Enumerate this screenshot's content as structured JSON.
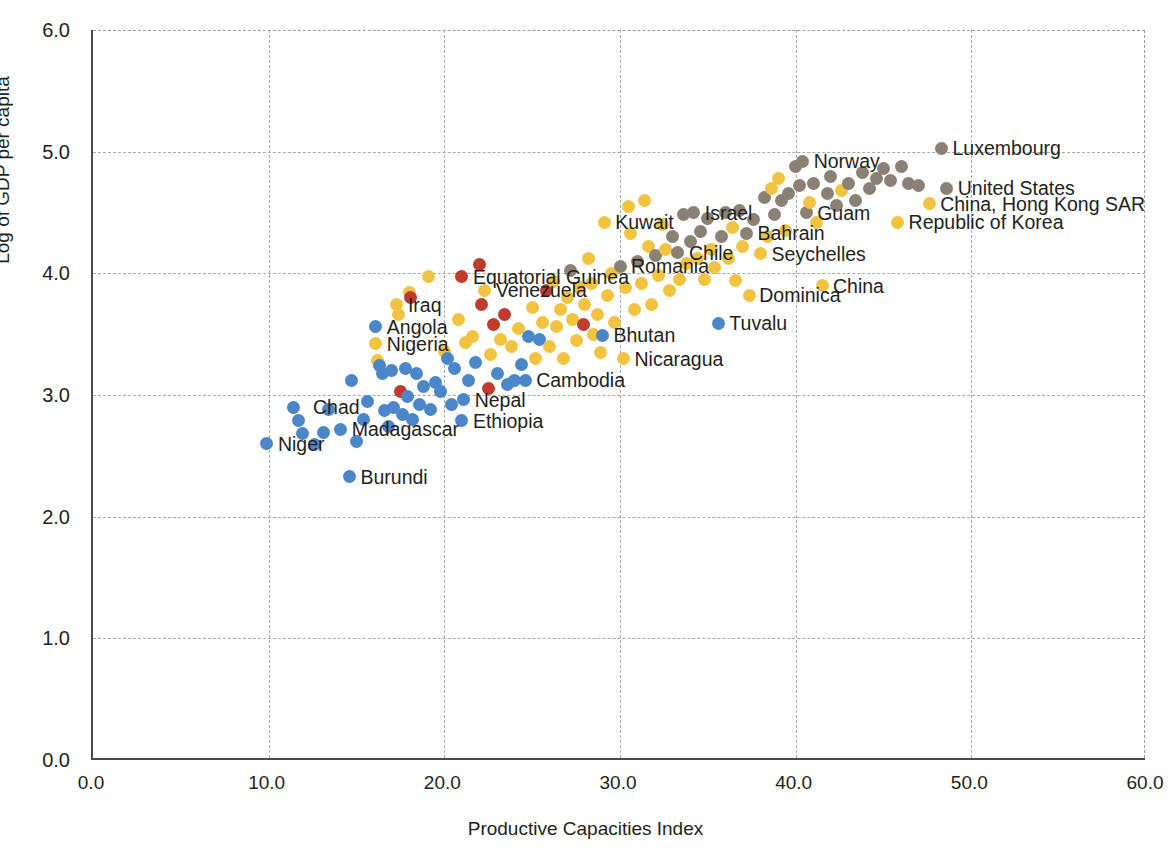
{
  "chart_data": {
    "type": "scatter",
    "title": "",
    "xlabel": "Productive Capacities Index",
    "ylabel": "Log of GDP per capita",
    "xlim": [
      0,
      60
    ],
    "ylim": [
      0,
      6
    ],
    "xticks": [
      "0.0",
      "10.0",
      "20.0",
      "30.0",
      "40.0",
      "50.0",
      "60.0"
    ],
    "yticks": [
      "0.0",
      "1.0",
      "2.0",
      "3.0",
      "4.0",
      "5.0",
      "6.0"
    ],
    "xtick_values": [
      0,
      10,
      20,
      30,
      40,
      50,
      60
    ],
    "ytick_values": [
      0,
      1,
      2,
      3,
      4,
      5,
      6
    ],
    "grid": true,
    "legend": "none",
    "colors": {
      "blue": "#4a86c8",
      "yellow": "#f2c340",
      "red": "#bf3b2b",
      "gray": "#8a8073"
    },
    "group_names": {
      "blue": "Least developed countries",
      "yellow": "Other developing countries",
      "red": "Landlocked / oil exporters",
      "gray": "Developed countries"
    },
    "annotations": [
      {
        "text": "Luxembourg",
        "x": 48.3,
        "y": 5.03,
        "side": "right"
      },
      {
        "text": "Norway",
        "x": 40.4,
        "y": 4.92,
        "side": "right"
      },
      {
        "text": "United States",
        "x": 48.6,
        "y": 4.7,
        "side": "right"
      },
      {
        "text": "China, Hong Kong SAR",
        "x": 47.6,
        "y": 4.57,
        "side": "right"
      },
      {
        "text": "Republic of Korea",
        "x": 45.8,
        "y": 4.42,
        "side": "right"
      },
      {
        "text": "Guam",
        "x": 40.6,
        "y": 4.5,
        "side": "right"
      },
      {
        "text": "Israel",
        "x": 34.2,
        "y": 4.5,
        "side": "right"
      },
      {
        "text": "Kuwait",
        "x": 29.1,
        "y": 4.42,
        "side": "right"
      },
      {
        "text": "Bahrain",
        "x": 37.2,
        "y": 4.33,
        "side": "right"
      },
      {
        "text": "Seychelles",
        "x": 38.0,
        "y": 4.16,
        "side": "right"
      },
      {
        "text": "Chile",
        "x": 33.3,
        "y": 4.17,
        "side": "right"
      },
      {
        "text": "Romania",
        "x": 30.0,
        "y": 4.06,
        "side": "right"
      },
      {
        "text": "China",
        "x": 41.5,
        "y": 3.9,
        "side": "right"
      },
      {
        "text": "Dominica",
        "x": 37.3,
        "y": 3.82,
        "side": "right"
      },
      {
        "text": "Equatorial Guinea",
        "x": 21.0,
        "y": 3.97,
        "side": "right"
      },
      {
        "text": "Venezuela",
        "x": 22.3,
        "y": 3.86,
        "side": "right"
      },
      {
        "text": "Iraq",
        "x": 17.3,
        "y": 3.74,
        "side": "right"
      },
      {
        "text": "Tuvalu",
        "x": 35.6,
        "y": 3.59,
        "side": "right"
      },
      {
        "text": "Angola",
        "x": 16.1,
        "y": 3.56,
        "side": "right"
      },
      {
        "text": "Bhutan",
        "x": 29.0,
        "y": 3.49,
        "side": "right"
      },
      {
        "text": "Nigeria",
        "x": 16.1,
        "y": 3.42,
        "side": "right"
      },
      {
        "text": "Nicaragua",
        "x": 30.2,
        "y": 3.3,
        "side": "right"
      },
      {
        "text": "Cambodia",
        "x": 24.6,
        "y": 3.12,
        "side": "right"
      },
      {
        "text": "Nepal",
        "x": 21.1,
        "y": 2.96,
        "side": "right"
      },
      {
        "text": "Chad",
        "x": 11.9,
        "y": 2.9,
        "side": "right"
      },
      {
        "text": "Ethiopia",
        "x": 21.0,
        "y": 2.79,
        "side": "right"
      },
      {
        "text": "Madagascar",
        "x": 14.1,
        "y": 2.72,
        "side": "right"
      },
      {
        "text": "Niger",
        "x": 9.9,
        "y": 2.6,
        "side": "right"
      },
      {
        "text": "Burundi",
        "x": 14.6,
        "y": 2.33,
        "side": "right"
      }
    ],
    "points": [
      {
        "x": 9.9,
        "y": 2.6,
        "c": "blue"
      },
      {
        "x": 11.4,
        "y": 2.9,
        "c": "blue"
      },
      {
        "x": 11.7,
        "y": 2.79,
        "c": "blue"
      },
      {
        "x": 11.9,
        "y": 2.68,
        "c": "blue"
      },
      {
        "x": 12.6,
        "y": 2.59,
        "c": "blue"
      },
      {
        "x": 13.1,
        "y": 2.69,
        "c": "blue"
      },
      {
        "x": 13.4,
        "y": 2.88,
        "c": "blue"
      },
      {
        "x": 14.1,
        "y": 2.72,
        "c": "blue"
      },
      {
        "x": 14.6,
        "y": 2.33,
        "c": "blue"
      },
      {
        "x": 14.7,
        "y": 3.12,
        "c": "blue"
      },
      {
        "x": 15.0,
        "y": 2.62,
        "c": "blue"
      },
      {
        "x": 15.4,
        "y": 2.8,
        "c": "blue"
      },
      {
        "x": 15.6,
        "y": 2.95,
        "c": "blue"
      },
      {
        "x": 16.1,
        "y": 3.56,
        "c": "blue"
      },
      {
        "x": 16.1,
        "y": 3.42,
        "c": "yellow"
      },
      {
        "x": 16.2,
        "y": 3.28,
        "c": "yellow"
      },
      {
        "x": 16.3,
        "y": 3.24,
        "c": "blue"
      },
      {
        "x": 16.5,
        "y": 3.18,
        "c": "blue"
      },
      {
        "x": 16.6,
        "y": 2.87,
        "c": "blue"
      },
      {
        "x": 16.8,
        "y": 2.74,
        "c": "blue"
      },
      {
        "x": 17.0,
        "y": 3.2,
        "c": "blue"
      },
      {
        "x": 17.1,
        "y": 2.9,
        "c": "blue"
      },
      {
        "x": 17.3,
        "y": 3.74,
        "c": "yellow"
      },
      {
        "x": 17.4,
        "y": 3.66,
        "c": "yellow"
      },
      {
        "x": 17.5,
        "y": 3.03,
        "c": "red"
      },
      {
        "x": 17.6,
        "y": 2.84,
        "c": "blue"
      },
      {
        "x": 17.8,
        "y": 3.22,
        "c": "blue"
      },
      {
        "x": 17.9,
        "y": 2.99,
        "c": "blue"
      },
      {
        "x": 18.0,
        "y": 3.84,
        "c": "yellow"
      },
      {
        "x": 18.1,
        "y": 3.8,
        "c": "red"
      },
      {
        "x": 18.2,
        "y": 2.8,
        "c": "blue"
      },
      {
        "x": 18.4,
        "y": 3.18,
        "c": "blue"
      },
      {
        "x": 18.6,
        "y": 2.92,
        "c": "blue"
      },
      {
        "x": 18.8,
        "y": 3.07,
        "c": "blue"
      },
      {
        "x": 19.1,
        "y": 3.97,
        "c": "yellow"
      },
      {
        "x": 19.2,
        "y": 2.88,
        "c": "blue"
      },
      {
        "x": 19.5,
        "y": 3.1,
        "c": "blue"
      },
      {
        "x": 19.8,
        "y": 3.03,
        "c": "blue"
      },
      {
        "x": 20.0,
        "y": 3.36,
        "c": "yellow"
      },
      {
        "x": 20.2,
        "y": 3.3,
        "c": "blue"
      },
      {
        "x": 20.4,
        "y": 2.92,
        "c": "blue"
      },
      {
        "x": 20.6,
        "y": 3.22,
        "c": "blue"
      },
      {
        "x": 20.8,
        "y": 3.62,
        "c": "yellow"
      },
      {
        "x": 21.0,
        "y": 3.97,
        "c": "red"
      },
      {
        "x": 21.0,
        "y": 2.79,
        "c": "blue"
      },
      {
        "x": 21.1,
        "y": 2.96,
        "c": "blue"
      },
      {
        "x": 21.2,
        "y": 3.43,
        "c": "yellow"
      },
      {
        "x": 21.4,
        "y": 3.12,
        "c": "blue"
      },
      {
        "x": 21.6,
        "y": 3.48,
        "c": "yellow"
      },
      {
        "x": 21.8,
        "y": 3.27,
        "c": "blue"
      },
      {
        "x": 22.0,
        "y": 4.07,
        "c": "red"
      },
      {
        "x": 22.1,
        "y": 3.74,
        "c": "red"
      },
      {
        "x": 22.3,
        "y": 3.86,
        "c": "yellow"
      },
      {
        "x": 22.5,
        "y": 3.05,
        "c": "red"
      },
      {
        "x": 22.6,
        "y": 3.33,
        "c": "yellow"
      },
      {
        "x": 22.8,
        "y": 3.58,
        "c": "red"
      },
      {
        "x": 23.0,
        "y": 3.18,
        "c": "blue"
      },
      {
        "x": 23.2,
        "y": 3.46,
        "c": "yellow"
      },
      {
        "x": 23.4,
        "y": 3.66,
        "c": "red"
      },
      {
        "x": 23.6,
        "y": 3.09,
        "c": "blue"
      },
      {
        "x": 23.8,
        "y": 3.4,
        "c": "yellow"
      },
      {
        "x": 24.0,
        "y": 3.12,
        "c": "blue"
      },
      {
        "x": 24.2,
        "y": 3.55,
        "c": "yellow"
      },
      {
        "x": 24.4,
        "y": 3.25,
        "c": "blue"
      },
      {
        "x": 24.6,
        "y": 3.12,
        "c": "blue"
      },
      {
        "x": 24.8,
        "y": 3.48,
        "c": "blue"
      },
      {
        "x": 25.0,
        "y": 3.72,
        "c": "yellow"
      },
      {
        "x": 25.2,
        "y": 3.3,
        "c": "yellow"
      },
      {
        "x": 25.4,
        "y": 3.46,
        "c": "blue"
      },
      {
        "x": 25.6,
        "y": 3.6,
        "c": "yellow"
      },
      {
        "x": 25.8,
        "y": 3.86,
        "c": "red"
      },
      {
        "x": 26.0,
        "y": 3.4,
        "c": "yellow"
      },
      {
        "x": 26.2,
        "y": 3.93,
        "c": "yellow"
      },
      {
        "x": 26.4,
        "y": 3.56,
        "c": "yellow"
      },
      {
        "x": 26.6,
        "y": 3.7,
        "c": "yellow"
      },
      {
        "x": 26.8,
        "y": 3.3,
        "c": "yellow"
      },
      {
        "x": 27.0,
        "y": 3.8,
        "c": "yellow"
      },
      {
        "x": 27.2,
        "y": 4.02,
        "c": "gray"
      },
      {
        "x": 27.3,
        "y": 3.62,
        "c": "yellow"
      },
      {
        "x": 27.5,
        "y": 3.45,
        "c": "yellow"
      },
      {
        "x": 27.7,
        "y": 3.88,
        "c": "yellow"
      },
      {
        "x": 27.9,
        "y": 3.58,
        "c": "red"
      },
      {
        "x": 28.0,
        "y": 3.74,
        "c": "yellow"
      },
      {
        "x": 28.2,
        "y": 4.12,
        "c": "yellow"
      },
      {
        "x": 28.4,
        "y": 3.92,
        "c": "yellow"
      },
      {
        "x": 28.5,
        "y": 3.5,
        "c": "yellow"
      },
      {
        "x": 28.7,
        "y": 3.66,
        "c": "yellow"
      },
      {
        "x": 28.9,
        "y": 3.35,
        "c": "yellow"
      },
      {
        "x": 29.0,
        "y": 3.49,
        "c": "blue"
      },
      {
        "x": 29.1,
        "y": 4.42,
        "c": "yellow"
      },
      {
        "x": 29.3,
        "y": 3.82,
        "c": "yellow"
      },
      {
        "x": 29.5,
        "y": 4.0,
        "c": "yellow"
      },
      {
        "x": 29.7,
        "y": 3.6,
        "c": "yellow"
      },
      {
        "x": 30.0,
        "y": 4.06,
        "c": "gray"
      },
      {
        "x": 30.2,
        "y": 3.3,
        "c": "yellow"
      },
      {
        "x": 30.3,
        "y": 3.88,
        "c": "yellow"
      },
      {
        "x": 30.5,
        "y": 4.55,
        "c": "yellow"
      },
      {
        "x": 30.6,
        "y": 4.33,
        "c": "yellow"
      },
      {
        "x": 30.8,
        "y": 3.7,
        "c": "yellow"
      },
      {
        "x": 31.0,
        "y": 4.1,
        "c": "gray"
      },
      {
        "x": 31.2,
        "y": 3.92,
        "c": "yellow"
      },
      {
        "x": 31.4,
        "y": 4.6,
        "c": "yellow"
      },
      {
        "x": 31.6,
        "y": 4.22,
        "c": "yellow"
      },
      {
        "x": 31.8,
        "y": 3.74,
        "c": "yellow"
      },
      {
        "x": 32.0,
        "y": 4.15,
        "c": "gray"
      },
      {
        "x": 32.2,
        "y": 3.98,
        "c": "yellow"
      },
      {
        "x": 32.4,
        "y": 4.4,
        "c": "yellow"
      },
      {
        "x": 32.6,
        "y": 4.2,
        "c": "yellow"
      },
      {
        "x": 32.8,
        "y": 3.86,
        "c": "yellow"
      },
      {
        "x": 33.0,
        "y": 4.3,
        "c": "gray"
      },
      {
        "x": 33.3,
        "y": 4.17,
        "c": "gray"
      },
      {
        "x": 33.4,
        "y": 3.95,
        "c": "yellow"
      },
      {
        "x": 33.6,
        "y": 4.48,
        "c": "gray"
      },
      {
        "x": 33.8,
        "y": 4.08,
        "c": "yellow"
      },
      {
        "x": 34.0,
        "y": 4.26,
        "c": "gray"
      },
      {
        "x": 34.2,
        "y": 4.5,
        "c": "gray"
      },
      {
        "x": 34.4,
        "y": 4.12,
        "c": "yellow"
      },
      {
        "x": 34.6,
        "y": 4.34,
        "c": "gray"
      },
      {
        "x": 34.8,
        "y": 3.95,
        "c": "yellow"
      },
      {
        "x": 35.0,
        "y": 4.45,
        "c": "gray"
      },
      {
        "x": 35.2,
        "y": 4.2,
        "c": "yellow"
      },
      {
        "x": 35.4,
        "y": 4.05,
        "c": "yellow"
      },
      {
        "x": 35.6,
        "y": 3.59,
        "c": "blue"
      },
      {
        "x": 35.8,
        "y": 4.3,
        "c": "gray"
      },
      {
        "x": 36.0,
        "y": 4.5,
        "c": "gray"
      },
      {
        "x": 36.2,
        "y": 4.12,
        "c": "yellow"
      },
      {
        "x": 36.4,
        "y": 4.38,
        "c": "yellow"
      },
      {
        "x": 36.6,
        "y": 3.94,
        "c": "yellow"
      },
      {
        "x": 36.8,
        "y": 4.52,
        "c": "gray"
      },
      {
        "x": 37.0,
        "y": 4.22,
        "c": "yellow"
      },
      {
        "x": 37.2,
        "y": 4.33,
        "c": "gray"
      },
      {
        "x": 37.4,
        "y": 3.82,
        "c": "yellow"
      },
      {
        "x": 37.6,
        "y": 4.44,
        "c": "gray"
      },
      {
        "x": 38.0,
        "y": 4.16,
        "c": "yellow"
      },
      {
        "x": 38.2,
        "y": 4.62,
        "c": "gray"
      },
      {
        "x": 38.4,
        "y": 4.3,
        "c": "yellow"
      },
      {
        "x": 38.6,
        "y": 4.7,
        "c": "yellow"
      },
      {
        "x": 38.8,
        "y": 4.48,
        "c": "gray"
      },
      {
        "x": 39.0,
        "y": 4.78,
        "c": "yellow"
      },
      {
        "x": 39.2,
        "y": 4.6,
        "c": "gray"
      },
      {
        "x": 39.4,
        "y": 4.35,
        "c": "yellow"
      },
      {
        "x": 39.6,
        "y": 4.66,
        "c": "gray"
      },
      {
        "x": 40.0,
        "y": 4.88,
        "c": "gray"
      },
      {
        "x": 40.2,
        "y": 4.72,
        "c": "gray"
      },
      {
        "x": 40.4,
        "y": 4.92,
        "c": "gray"
      },
      {
        "x": 40.6,
        "y": 4.5,
        "c": "gray"
      },
      {
        "x": 40.8,
        "y": 4.58,
        "c": "yellow"
      },
      {
        "x": 41.0,
        "y": 4.74,
        "c": "gray"
      },
      {
        "x": 41.2,
        "y": 4.42,
        "c": "yellow"
      },
      {
        "x": 41.5,
        "y": 3.9,
        "c": "yellow"
      },
      {
        "x": 41.8,
        "y": 4.66,
        "c": "gray"
      },
      {
        "x": 42.0,
        "y": 4.8,
        "c": "gray"
      },
      {
        "x": 42.3,
        "y": 4.56,
        "c": "gray"
      },
      {
        "x": 42.6,
        "y": 4.68,
        "c": "yellow"
      },
      {
        "x": 43.0,
        "y": 4.74,
        "c": "gray"
      },
      {
        "x": 43.4,
        "y": 4.6,
        "c": "gray"
      },
      {
        "x": 43.8,
        "y": 4.83,
        "c": "gray"
      },
      {
        "x": 44.2,
        "y": 4.7,
        "c": "gray"
      },
      {
        "x": 44.6,
        "y": 4.78,
        "c": "gray"
      },
      {
        "x": 45.0,
        "y": 4.86,
        "c": "gray"
      },
      {
        "x": 45.4,
        "y": 4.76,
        "c": "gray"
      },
      {
        "x": 45.8,
        "y": 4.42,
        "c": "yellow"
      },
      {
        "x": 46.0,
        "y": 4.88,
        "c": "gray"
      },
      {
        "x": 46.4,
        "y": 4.74,
        "c": "gray"
      },
      {
        "x": 47.0,
        "y": 4.72,
        "c": "gray"
      },
      {
        "x": 47.6,
        "y": 4.57,
        "c": "yellow"
      },
      {
        "x": 48.3,
        "y": 5.03,
        "c": "gray"
      },
      {
        "x": 48.6,
        "y": 4.7,
        "c": "gray"
      }
    ]
  }
}
